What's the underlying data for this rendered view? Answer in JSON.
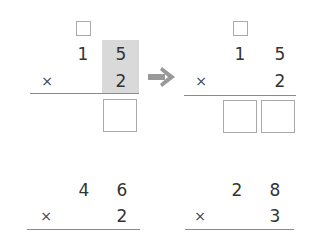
{
  "problems": [
    {
      "id": "top-left",
      "carry_box": true,
      "multiplicand": {
        "tens": "1",
        "ones": "5"
      },
      "operator": "×",
      "multiplier": {
        "ones": "2"
      },
      "highlight_column": "ones",
      "answer_boxes": 1
    },
    {
      "id": "top-right",
      "carry_box": true,
      "multiplicand": {
        "tens": "1",
        "ones": "5"
      },
      "operator": "×",
      "multiplier": {
        "ones": "2"
      },
      "answer_boxes": 2
    },
    {
      "id": "bottom-left",
      "multiplicand": {
        "tens": "4",
        "ones": "6"
      },
      "operator": "×",
      "multiplier": {
        "ones": "2"
      }
    },
    {
      "id": "bottom-right",
      "multiplicand": {
        "tens": "2",
        "ones": "8"
      },
      "operator": "×",
      "multiplier": {
        "ones": "3"
      }
    }
  ],
  "arrow": {
    "icon": "right-arrow-icon",
    "color": "#999999"
  },
  "colors": {
    "highlight": "#d9d9d9",
    "text": "#333333",
    "rule": "#8a8a8a",
    "box_border": "#aaaaaa"
  }
}
